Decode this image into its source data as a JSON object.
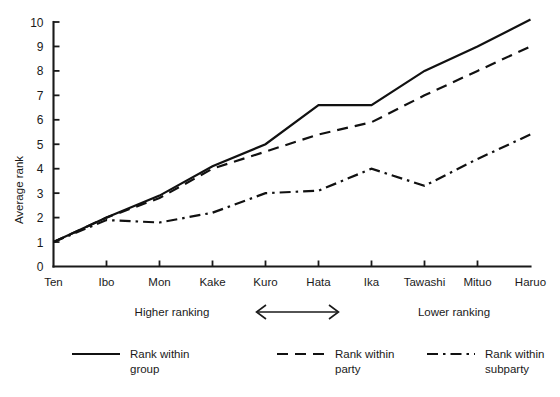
{
  "chart_data": {
    "type": "line",
    "title": "",
    "xlabel": "",
    "ylabel": "Average rank",
    "ylim": [
      0,
      10
    ],
    "yticks": [
      0,
      1,
      2,
      3,
      4,
      5,
      6,
      7,
      8,
      9,
      10
    ],
    "grid": false,
    "legend_position": "bottom",
    "categories": [
      "Ten",
      "Ibo",
      "Mon",
      "Kake",
      "Kuro",
      "Hata",
      "Ika",
      "Tawashi",
      "Mituo",
      "Haruo"
    ],
    "series": [
      {
        "name": "Rank within group",
        "style": "solid",
        "values": [
          1.0,
          2.0,
          2.9,
          4.1,
          5.0,
          6.6,
          6.6,
          8.0,
          9.0,
          10.1
        ]
      },
      {
        "name": "Rank within party",
        "style": "dashed",
        "values": [
          1.0,
          2.0,
          2.8,
          4.0,
          4.7,
          5.4,
          5.9,
          7.0,
          8.0,
          9.0
        ]
      },
      {
        "name": "Rank within subparty",
        "style": "dash-dot",
        "values": [
          1.0,
          1.9,
          1.8,
          2.2,
          3.0,
          3.1,
          4.0,
          3.3,
          4.4,
          5.4
        ]
      }
    ],
    "annotations": [
      {
        "id": "higher-ranking",
        "text": "Higher ranking",
        "x_center_category": 2.5
      },
      {
        "id": "lower-ranking",
        "text": "Lower ranking",
        "x_center_category": 7.6
      },
      {
        "id": "range-arrow",
        "text": "",
        "from_category": "Kuro",
        "to_category": "Hata"
      }
    ]
  },
  "axis": {
    "y_title": "Average rank",
    "y_tick_labels": [
      "0",
      "1",
      "2",
      "3",
      "4",
      "5",
      "6",
      "7",
      "8",
      "9",
      "10"
    ],
    "x_tick_labels": [
      "Ten",
      "Ibo",
      "Mon",
      "Kake",
      "Kuro",
      "Hata",
      "Ika",
      "Tawashi",
      "Mituo",
      "Haruo"
    ]
  },
  "annotations": {
    "higher_ranking": "Higher ranking",
    "lower_ranking": "Lower ranking"
  },
  "legend": {
    "items": [
      {
        "label_line1": "Rank within",
        "label_line2": "group",
        "style": "solid"
      },
      {
        "label_line1": "Rank within",
        "label_line2": "party",
        "style": "dashed"
      },
      {
        "label_line1": "Rank within",
        "label_line2": "subparty",
        "style": "dash-dot"
      }
    ]
  },
  "colors": {
    "ink": "#1a1a1a",
    "background": "#ffffff"
  }
}
